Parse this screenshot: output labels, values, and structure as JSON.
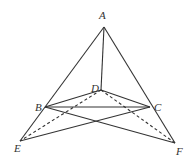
{
  "diagram": {
    "type": "geometry",
    "points": {
      "A": {
        "label": "A",
        "x": 104,
        "y": 27,
        "lx": 99,
        "ly": 19
      },
      "B": {
        "label": "B",
        "x": 45,
        "y": 107,
        "lx": 35,
        "ly": 111
      },
      "C": {
        "label": "C",
        "x": 150,
        "y": 107,
        "lx": 154,
        "ly": 111
      },
      "D": {
        "label": "D",
        "x": 101,
        "y": 90,
        "lx": 91,
        "ly": 92
      },
      "E": {
        "label": "E",
        "x": 20,
        "y": 141,
        "lx": 14,
        "ly": 152
      },
      "F": {
        "label": "F",
        "x": 175,
        "y": 143,
        "lx": 176,
        "ly": 155
      }
    },
    "solid_segments": [
      [
        "A",
        "E"
      ],
      [
        "A",
        "F"
      ],
      [
        "A",
        "D"
      ],
      [
        "B",
        "D"
      ],
      [
        "D",
        "C"
      ],
      [
        "B",
        "C"
      ],
      [
        "B",
        "F"
      ],
      [
        "E",
        "C"
      ]
    ],
    "dashed_segments": [
      [
        "D",
        "E"
      ],
      [
        "D",
        "F"
      ]
    ],
    "stroke_color": "#333333"
  }
}
